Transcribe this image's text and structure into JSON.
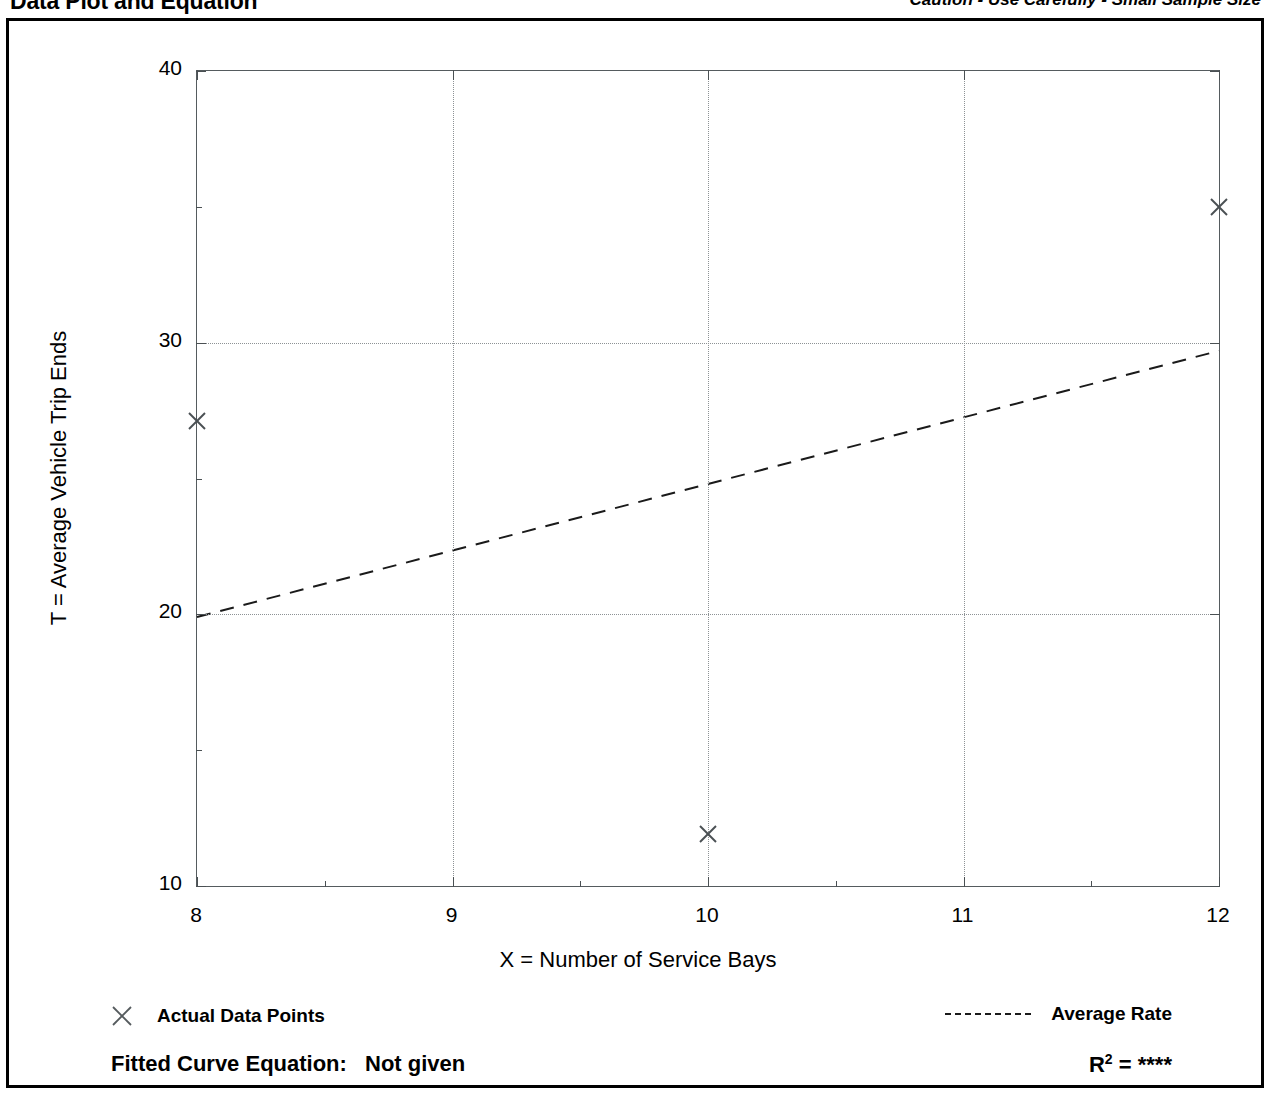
{
  "header": {
    "title": "Data Plot and Equation",
    "caution": "Caution - Use Carefully - Small Sample Size"
  },
  "legend": {
    "data_points_label": "Actual Data Points",
    "data_points_icon": "x-marker-icon",
    "average_rate_label": "Average Rate",
    "average_rate_icon": "dashed-line-icon"
  },
  "footer": {
    "equation_label": "Fitted Curve Equation:",
    "equation_value": "Not given",
    "r2_label": "R",
    "r2_exponent": "2",
    "r2_equals": "=",
    "r2_value": "****"
  },
  "colors": {
    "axis": "#4a5053",
    "grid": "#8d9295",
    "series": "#1a1a1a",
    "text": "#000000",
    "frame": "#000000",
    "background": "#ffffff"
  },
  "chart_data": {
    "type": "scatter",
    "title": "Data Plot and Equation",
    "xlabel": "X = Number of Service Bays",
    "ylabel": "T = Average Vehicle Trip Ends",
    "xlim": [
      8,
      12
    ],
    "ylim": [
      10,
      40
    ],
    "xticks": [
      8,
      9,
      10,
      11,
      12
    ],
    "xtick_labels": [
      "8",
      "9",
      "10",
      "11",
      "12"
    ],
    "xminorticks": [
      8.5,
      9.5,
      10.5,
      11.5
    ],
    "yticks": [
      10,
      20,
      30,
      40
    ],
    "ytick_labels": [
      "10",
      "20",
      "30",
      "40"
    ],
    "yminorticks": [
      15,
      25,
      35
    ],
    "grid": true,
    "grid_x": [
      9,
      10,
      11
    ],
    "grid_y": [
      20,
      30
    ],
    "grid_style": "dotted",
    "legend_position": "below-plot",
    "series": [
      {
        "name": "Actual Data Points",
        "type": "scatter",
        "marker": "x",
        "points": [
          {
            "x": 8,
            "y": 27.1
          },
          {
            "x": 10,
            "y": 11.9
          },
          {
            "x": 12,
            "y": 35.0
          }
        ]
      },
      {
        "name": "Average Rate",
        "type": "line",
        "style": "dashed",
        "points": [
          {
            "x": 8,
            "y": 19.9
          },
          {
            "x": 12,
            "y": 29.7
          }
        ]
      }
    ]
  }
}
